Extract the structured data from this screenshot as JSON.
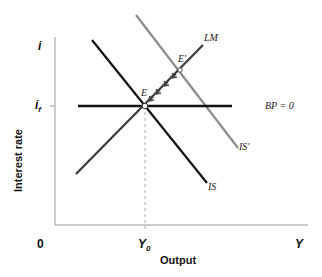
{
  "diagram": {
    "type": "IS-LM-BP economics diagram",
    "axes": {
      "x_title": "Output",
      "y_title": "Interest rate",
      "origin_label": "0",
      "x_end_label": "Y",
      "y_end_label": "i",
      "x_tick_label": "Y",
      "x_tick_sub": "0",
      "y_tick_label": "i",
      "y_tick_sub": "f"
    },
    "curves": [
      {
        "name": "IS",
        "label": "IS",
        "color": "#111111"
      },
      {
        "name": "IS'",
        "label": "IS'",
        "color": "#8c8c8c"
      },
      {
        "name": "LM",
        "label": "LM",
        "color": "#3a3a3a"
      },
      {
        "name": "BP=0",
        "label": "BP = 0",
        "color": "#111111"
      }
    ],
    "points": [
      {
        "name": "E",
        "label": "E"
      },
      {
        "name": "E'",
        "label": "E'"
      }
    ],
    "arrows": "Movement along LM from E' back to E"
  }
}
